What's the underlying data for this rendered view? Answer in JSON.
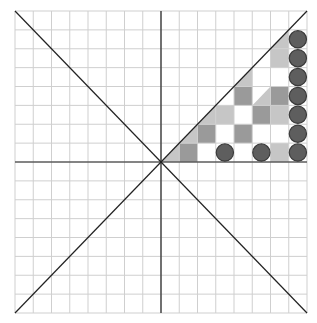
{
  "board": {
    "cols": 16,
    "rows": 16,
    "origin": {
      "x": 15,
      "y": 11
    },
    "width": 292,
    "height": 302,
    "colors": {
      "background": "#ffffff",
      "grid_line": "#cfcfcf",
      "axis_line": "#222222",
      "dark_cell": "#9a9a9a",
      "light_cell": "#c6c6c6",
      "piece_fill": "#5e5e5e",
      "piece_stroke": "#3a3a3a"
    },
    "cells": [
      {
        "row": 7,
        "col": 8,
        "type": "diag-light"
      },
      {
        "row": 7,
        "col": 9,
        "type": "dark"
      },
      {
        "row": 7,
        "col": 14,
        "type": "light"
      },
      {
        "row": 6,
        "col": 9,
        "type": "diag-light"
      },
      {
        "row": 6,
        "col": 10,
        "type": "dark"
      },
      {
        "row": 6,
        "col": 12,
        "type": "dark"
      },
      {
        "row": 5,
        "col": 10,
        "type": "diag-light"
      },
      {
        "row": 5,
        "col": 11,
        "type": "light"
      },
      {
        "row": 5,
        "col": 13,
        "type": "dark"
      },
      {
        "row": 5,
        "col": 14,
        "type": "light"
      },
      {
        "row": 4,
        "col": 12,
        "type": "dark"
      },
      {
        "row": 4,
        "col": 13,
        "type": "diag-light"
      },
      {
        "row": 4,
        "col": 14,
        "type": "dark"
      },
      {
        "row": 3,
        "col": 12,
        "type": "diag-light"
      },
      {
        "row": 2,
        "col": 14,
        "type": "light"
      },
      {
        "row": 1,
        "col": 14,
        "type": "diag-light"
      }
    ],
    "pieces": [
      {
        "row": 7,
        "col": 11
      },
      {
        "row": 7,
        "col": 13
      },
      {
        "row": 7,
        "col": 15
      },
      {
        "row": 6,
        "col": 15
      },
      {
        "row": 5,
        "col": 15
      },
      {
        "row": 4,
        "col": 15
      },
      {
        "row": 3,
        "col": 15
      },
      {
        "row": 2,
        "col": 15
      },
      {
        "row": 1,
        "col": 15
      }
    ]
  }
}
